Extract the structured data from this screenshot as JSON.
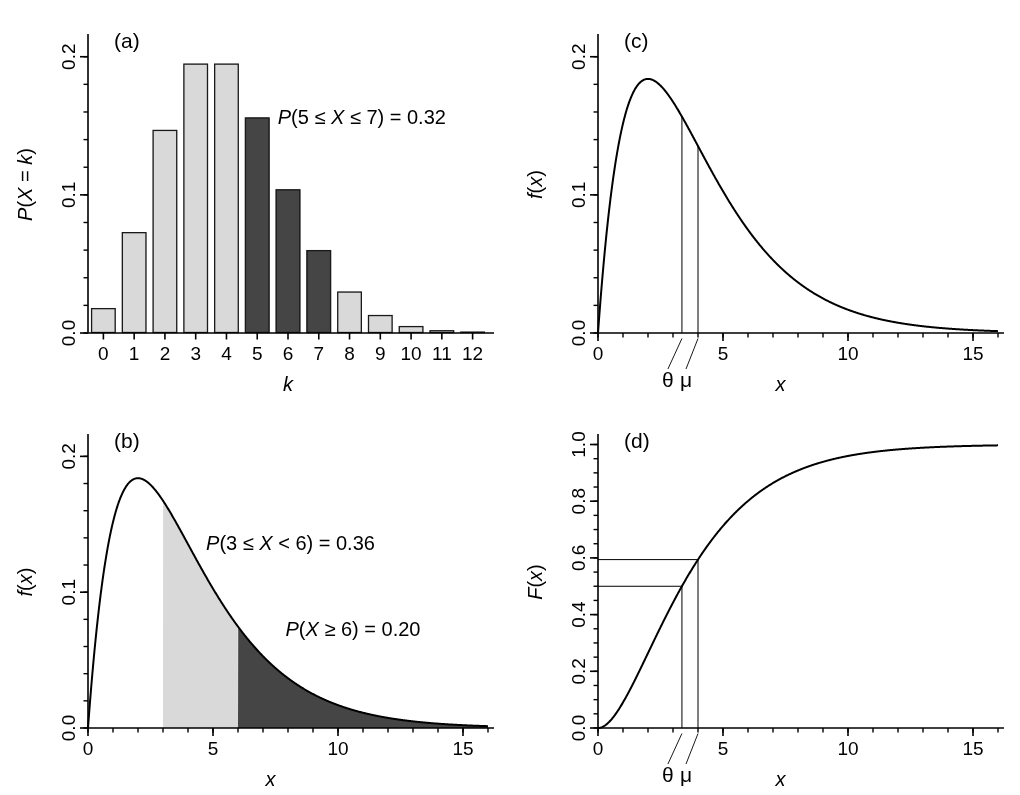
{
  "figure": {
    "width": 1020,
    "height": 795,
    "background": "#ffffff",
    "ink": "#000000",
    "fill_light": "#d9d9d9",
    "fill_dark": "#454545",
    "edge": "#1a1a1a"
  },
  "chart_data": [
    {
      "id": "panel-a",
      "type": "bar",
      "panel_label": "(a)",
      "title": "",
      "xlabel": "k",
      "ylabel": "P(X = k)",
      "xlabel_italic": true,
      "ylabel_italic": true,
      "categories": [
        0,
        1,
        2,
        3,
        4,
        5,
        6,
        7,
        8,
        9,
        10,
        11,
        12
      ],
      "values": [
        0.018,
        0.073,
        0.147,
        0.195,
        0.195,
        0.156,
        0.104,
        0.06,
        0.03,
        0.013,
        0.005,
        0.002,
        0.001
      ],
      "bar_colors": [
        "light",
        "light",
        "light",
        "light",
        "light",
        "dark",
        "dark",
        "dark",
        "light",
        "light",
        "light",
        "light",
        "light"
      ],
      "highlight_range": [
        5,
        7
      ],
      "xlim": [
        -0.5,
        12.5
      ],
      "ylim": [
        0.0,
        0.215
      ],
      "xticks": [
        0,
        1,
        2,
        3,
        4,
        5,
        6,
        7,
        8,
        9,
        10,
        11,
        12
      ],
      "xticklabels": [
        "0",
        "1",
        "2",
        "3",
        "4",
        "5",
        "6",
        "7",
        "8",
        "9",
        "10",
        "11",
        "12"
      ],
      "yticks": [
        0.0,
        0.1,
        0.2
      ],
      "yticklabels": [
        "0.0",
        "0.1",
        "0.2"
      ],
      "yminor_step": 0.02,
      "grid": false,
      "annotations": [
        {
          "text": "P(5 ≤ X ≤ 7) = 0.32",
          "x": 8.4,
          "y": 0.155,
          "italic_lead": true,
          "align": "center"
        }
      ]
    },
    {
      "id": "panel-b",
      "type": "area",
      "panel_label": "(b)",
      "title": "",
      "xlabel": "x",
      "ylabel": "f(x)",
      "xlabel_italic": true,
      "ylabel_italic": true,
      "distribution": {
        "name": "gamma",
        "shape": 2,
        "scale": 2
      },
      "xlim": [
        0,
        16
      ],
      "ylim": [
        0.0,
        0.215
      ],
      "xticks": [
        0,
        5,
        10,
        15
      ],
      "xticklabels": [
        "0",
        "5",
        "10",
        "15"
      ],
      "xminor_step": 1,
      "yticks": [
        0.0,
        0.1,
        0.2
      ],
      "yticklabels": [
        "0.0",
        "0.1",
        "0.2"
      ],
      "yminor_step": 0.02,
      "grid": false,
      "shaded_regions": [
        {
          "from": 3,
          "to": 6,
          "color": "light"
        },
        {
          "from": 6,
          "to": 16,
          "color": "dark"
        }
      ],
      "annotations": [
        {
          "text": "P(3 ≤ X < 6) = 0.36",
          "x": 8.1,
          "y": 0.135,
          "italic_lead": true,
          "align": "center"
        },
        {
          "text": "P(X ≥ 6) = 0.20",
          "x": 10.6,
          "y": 0.072,
          "italic_lead": true,
          "align": "center"
        }
      ]
    },
    {
      "id": "panel-c",
      "type": "line",
      "panel_label": "(c)",
      "title": "",
      "xlabel": "x",
      "ylabel": "f(x)",
      "xlabel_italic": true,
      "ylabel_italic": true,
      "distribution": {
        "name": "gamma",
        "shape": 2,
        "scale": 2
      },
      "xlim": [
        0,
        16
      ],
      "ylim": [
        0.0,
        0.215
      ],
      "xticks": [
        0,
        5,
        10,
        15
      ],
      "xticklabels": [
        "0",
        "5",
        "10",
        "15"
      ],
      "xminor_step": 1,
      "yticks": [
        0.0,
        0.1,
        0.2
      ],
      "yticklabels": [
        "0.0",
        "0.1",
        "0.2"
      ],
      "yminor_step": 0.02,
      "grid": false,
      "markers": [
        {
          "label": "θ",
          "x": 3.357,
          "kind": "vline-to-curve"
        },
        {
          "label": "μ",
          "x": 4.0,
          "kind": "vline-to-curve"
        }
      ]
    },
    {
      "id": "panel-d",
      "type": "line",
      "panel_label": "(d)",
      "title": "",
      "xlabel": "x",
      "ylabel": "F(x)",
      "xlabel_italic": true,
      "ylabel_italic": true,
      "distribution": {
        "name": "gamma-cdf",
        "shape": 2,
        "scale": 2
      },
      "xlim": [
        0,
        16
      ],
      "ylim": [
        0.0,
        1.03
      ],
      "xticks": [
        0,
        5,
        10,
        15
      ],
      "xticklabels": [
        "0",
        "5",
        "10",
        "15"
      ],
      "xminor_step": 1,
      "yticks": [
        0.0,
        0.2,
        0.4,
        0.6,
        0.8,
        1.0
      ],
      "yticklabels": [
        "0.0",
        "0.2",
        "0.4",
        "0.6",
        "0.8",
        "1.0"
      ],
      "yminor_step": 0.05,
      "grid": false,
      "markers": [
        {
          "label": "θ",
          "x": 3.357,
          "y": 0.5,
          "kind": "crosshair"
        },
        {
          "label": "μ",
          "x": 4.0,
          "y": 0.594,
          "kind": "crosshair"
        }
      ]
    }
  ]
}
